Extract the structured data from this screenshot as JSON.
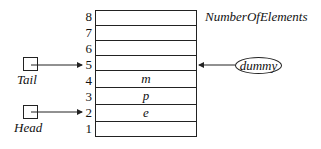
{
  "diagram": {
    "array_label": "NumberOfElements",
    "rows": [
      {
        "index": "1",
        "value": ""
      },
      {
        "index": "2",
        "value": "e"
      },
      {
        "index": "3",
        "value": "p"
      },
      {
        "index": "4",
        "value": "m"
      },
      {
        "index": "5",
        "value": ""
      },
      {
        "index": "6",
        "value": ""
      },
      {
        "index": "7",
        "value": ""
      },
      {
        "index": "8",
        "value": ""
      }
    ],
    "pointers": {
      "tail": {
        "label": "Tail",
        "points_to": "5"
      },
      "head": {
        "label": "Head",
        "points_to": "2"
      },
      "dummy": {
        "label": "dummy",
        "points_to": "5"
      }
    }
  }
}
